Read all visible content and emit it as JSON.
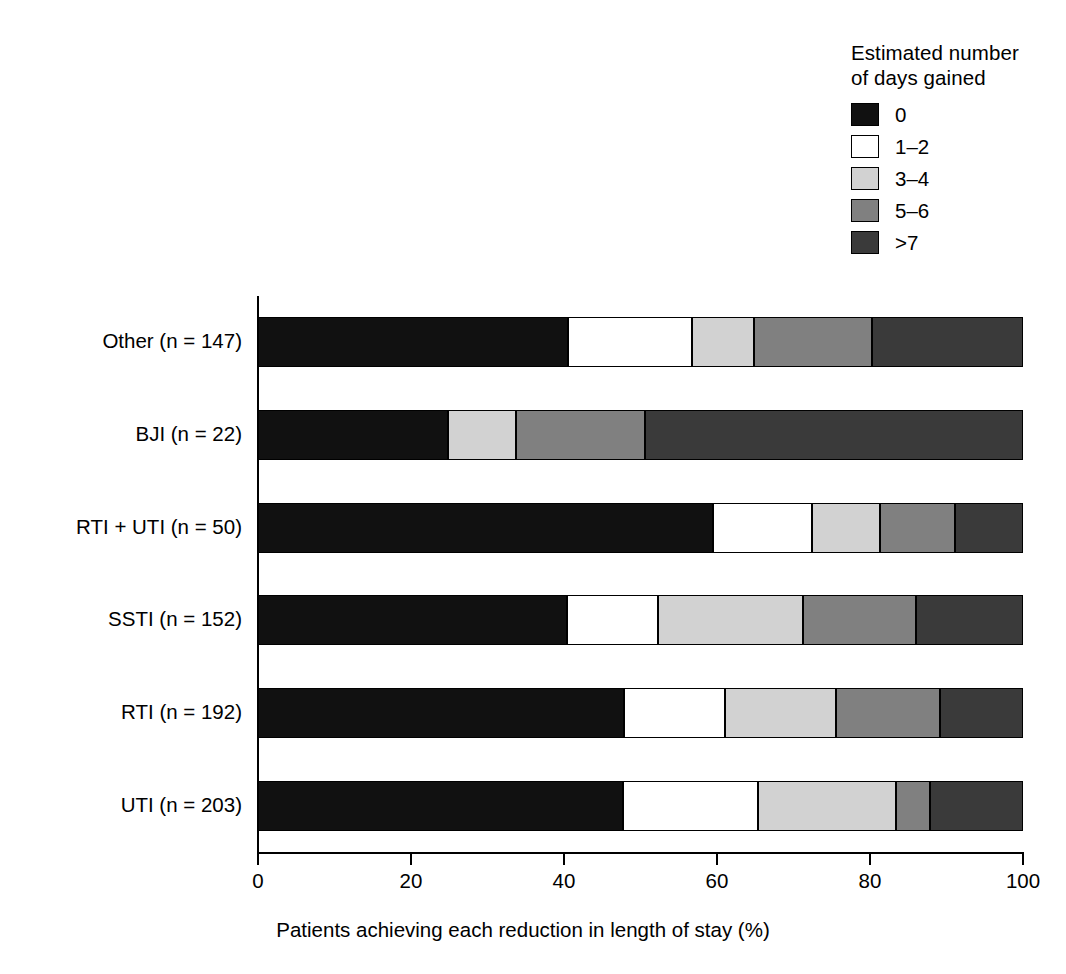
{
  "legend": {
    "title": "Estimated number\nof days gained",
    "entries": [
      {
        "label": "0",
        "color": "#111111",
        "swatch_name": "legend-swatch-0"
      },
      {
        "label": "1–2",
        "color": "#ffffff",
        "swatch_name": "legend-swatch-1-2"
      },
      {
        "label": "3–4",
        "color": "#d2d2d2",
        "swatch_name": "legend-swatch-3-4"
      },
      {
        "label": "5–6",
        "color": "#808080",
        "swatch_name": "legend-swatch-5-6"
      },
      {
        "label": ">7",
        "color": "#3a3a3a",
        "swatch_name": "legend-swatch-gt7"
      }
    ]
  },
  "axes": {
    "x_title": "Patients achieving each reduction in length of stay (%)",
    "y_title": "Infection",
    "x_ticks": [
      "0",
      "20",
      "40",
      "60",
      "80",
      "100"
    ]
  },
  "chart_data": {
    "type": "bar",
    "orientation": "horizontal",
    "stacked": true,
    "normalized_percent": true,
    "title": "",
    "xlabel": "Patients achieving each reduction in length of stay (%)",
    "ylabel": "Infection",
    "xlim": [
      0,
      100
    ],
    "xticks": [
      0,
      20,
      40,
      60,
      80,
      100
    ],
    "grid": false,
    "legend_title": "Estimated number of days gained",
    "legend_position": "top-right",
    "categories": [
      "Other (n = 147)",
      "BJI (n = 22)",
      "RTI + UTI  (n = 50)",
      "SSTI (n = 152)",
      "RTI (n = 192)",
      "UTI (n = 203)"
    ],
    "series": [
      {
        "name": "0",
        "color": "#111111",
        "values": [
          40.5,
          24.8,
          59.5,
          40.4,
          47.8,
          47.7
        ]
      },
      {
        "name": "1–2",
        "color": "#ffffff",
        "values": [
          16.2,
          0.0,
          12.9,
          11.9,
          13.2,
          17.7
        ]
      },
      {
        "name": "3–4",
        "color": "#d2d2d2",
        "values": [
          8.2,
          8.9,
          8.9,
          18.9,
          14.5,
          18.0
        ]
      },
      {
        "name": "5–6",
        "color": "#808080",
        "values": [
          15.4,
          16.9,
          9.8,
          14.8,
          13.7,
          4.5
        ]
      },
      {
        "name": ">7",
        "color": "#3a3a3a",
        "values": [
          19.7,
          49.4,
          8.9,
          14.0,
          10.8,
          12.1
        ]
      }
    ]
  }
}
